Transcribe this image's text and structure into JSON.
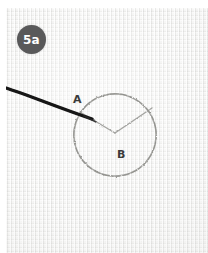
{
  "figure": {
    "badge_label": "5a",
    "caption_text": "",
    "background_color": "#f2f2f1",
    "badge_color": "#59595a",
    "badge_text_color": "#ffffff",
    "ink_color": "#8f8f8c",
    "probe_color": "#1a1a1a"
  },
  "annotations": {
    "points": [
      {
        "id": "A",
        "label": "A",
        "x": 72,
        "y": 92
      },
      {
        "id": "B",
        "label": "B",
        "x": 116,
        "y": 147
      }
    ]
  },
  "geometry": {
    "circle": {
      "cx": 115,
      "cy": 135,
      "r": 41
    },
    "vertex": {
      "x": 115,
      "y": 133
    },
    "arm_left_end": {
      "x": 80,
      "y": 112
    },
    "arm_right_end": {
      "x": 152,
      "y": 108
    },
    "probe_start": {
      "x": 8,
      "y": 90
    },
    "probe_end": {
      "x": 90,
      "y": 118
    }
  }
}
